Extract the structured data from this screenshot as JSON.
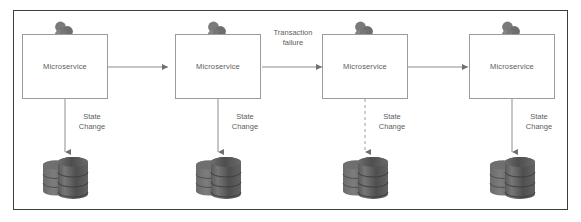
{
  "diagram": {
    "frame": {
      "border_color": "#3d3d3d"
    },
    "services": [
      {
        "id": "service-1",
        "label": "Microservice",
        "icon": "cluster-icon"
      },
      {
        "id": "service-2",
        "label": "Microservice",
        "icon": "cluster-icon"
      },
      {
        "id": "service-3",
        "label": "Microservice",
        "icon": "cluster-icon"
      },
      {
        "id": "service-4",
        "label": "Microservice",
        "icon": "cluster-icon"
      }
    ],
    "flow_labels": [
      {
        "id": "flow-1-2",
        "text": ""
      },
      {
        "id": "flow-2-3",
        "text": "Transaction failure",
        "line1": "Transaction",
        "line2": "failure"
      },
      {
        "id": "flow-3-4",
        "text": ""
      }
    ],
    "state_changes": [
      {
        "id": "state-change-1",
        "line1": "State",
        "line2": "Change",
        "style": "solid"
      },
      {
        "id": "state-change-2",
        "line1": "State",
        "line2": "Change",
        "style": "solid"
      },
      {
        "id": "state-change-3",
        "line1": "State",
        "line2": "Change",
        "style": "dashed"
      },
      {
        "id": "state-change-4",
        "line1": "State",
        "line2": "Change",
        "style": "solid"
      }
    ],
    "databases": [
      {
        "id": "database-1",
        "icon": "database-icon"
      },
      {
        "id": "database-2",
        "icon": "database-icon"
      },
      {
        "id": "database-3",
        "icon": "database-icon"
      },
      {
        "id": "database-4",
        "icon": "database-icon"
      }
    ],
    "colors": {
      "frame_border": "#3d3d3d",
      "box_border": "#9b9b9b",
      "text": "#5d5d5d",
      "connector": "#8d8d8d",
      "icon_gray": "#7c7c7c",
      "db_dark": "#545454",
      "background": "#ffffff"
    }
  }
}
